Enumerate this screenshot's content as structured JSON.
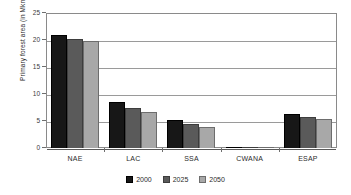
{
  "chart_data": {
    "type": "bar",
    "title": "",
    "xlabel": "",
    "ylabel": "Primary forest area (in Mkm",
    "ylabel_sup": "2",
    "ylabel_suffix": ")",
    "categories": [
      "NAE",
      "LAC",
      "SSA",
      "CWANA",
      "ESAP"
    ],
    "series": [
      {
        "name": "2000",
        "color": "#171717",
        "values": [
          21.0,
          8.5,
          5.1,
          0.05,
          6.3
        ]
      },
      {
        "name": "2025",
        "color": "#5a5a5a",
        "values": [
          20.2,
          7.4,
          4.5,
          0.05,
          5.7
        ]
      },
      {
        "name": "2050",
        "color": "#a8a8a8",
        "values": [
          19.8,
          6.7,
          3.9,
          0.05,
          5.3
        ]
      }
    ],
    "ylim": [
      0,
      25
    ],
    "yticks": [
      25,
      20,
      15,
      10,
      5,
      0
    ],
    "ytick_labels": [
      "25",
      "20",
      "15",
      "10",
      "5",
      "0"
    ],
    "grid": true,
    "legend_position": "bottom"
  }
}
